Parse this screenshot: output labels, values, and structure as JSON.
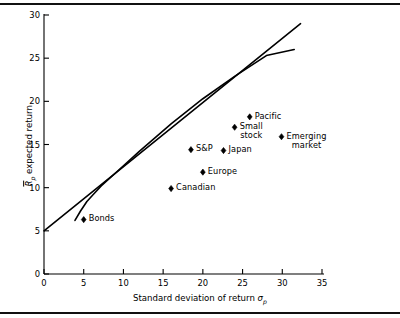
{
  "chart_data": {
    "type": "scatter",
    "title": "",
    "xlabel": "Standard deviation of return σp",
    "ylabel": "Rp expected return",
    "xlim": [
      0,
      35
    ],
    "ylim": [
      0,
      30
    ],
    "xticks": [
      0,
      5,
      10,
      15,
      20,
      25,
      30,
      35
    ],
    "yticks": [
      0,
      5,
      10,
      15,
      20,
      25,
      30
    ],
    "grid": false,
    "legend": "none",
    "points": [
      {
        "label": "Bonds",
        "x": 5.0,
        "y": 6.3,
        "label_lines": [
          "Bonds"
        ],
        "label_align": "right"
      },
      {
        "label": "Canadian",
        "x": 16.0,
        "y": 9.9,
        "label_lines": [
          "Canadian"
        ],
        "label_align": "right"
      },
      {
        "label": "Europe",
        "x": 20.0,
        "y": 11.8,
        "label_lines": [
          "Europe"
        ],
        "label_align": "right"
      },
      {
        "label": "S&P",
        "x": 18.5,
        "y": 14.4,
        "label_lines": [
          "S&P"
        ],
        "label_align": "right"
      },
      {
        "label": "Japan",
        "x": 22.6,
        "y": 14.3,
        "label_lines": [
          "Japan"
        ],
        "label_align": "right"
      },
      {
        "label": "Small stock",
        "x": 24.0,
        "y": 17.0,
        "label_lines": [
          "Small",
          "stock"
        ],
        "label_align": "right"
      },
      {
        "label": "Pacific",
        "x": 25.9,
        "y": 18.2,
        "label_lines": [
          "Pacific"
        ],
        "label_align": "right"
      },
      {
        "label": "Emerging market",
        "x": 29.9,
        "y": 15.9,
        "label_lines": [
          "Emerging",
          "market"
        ],
        "label_align": "right"
      }
    ],
    "lines": [
      {
        "name": "capital-market-line",
        "description": "Straight capital market line from the risk-free rate",
        "points": [
          [
            0,
            5.0
          ],
          [
            32.3,
            29.0
          ]
        ]
      },
      {
        "name": "efficient-frontier",
        "description": "Curved efficient frontier of risky assets, tangent to the capital market line",
        "points": [
          [
            3.9,
            6.2
          ],
          [
            4.6,
            7.3
          ],
          [
            5.4,
            8.4
          ],
          [
            6.2,
            9.2
          ],
          [
            7.2,
            10.2
          ],
          [
            9.0,
            11.7
          ],
          [
            12.0,
            14.2
          ],
          [
            16.0,
            17.4
          ],
          [
            20.0,
            20.3
          ],
          [
            24.0,
            22.9
          ],
          [
            28.0,
            25.3
          ],
          [
            31.5,
            26.0
          ]
        ]
      }
    ]
  },
  "axis": {
    "x_title_prefix": "Standard deviation of return ",
    "x_title_symbol": "σ",
    "x_title_sub": "p",
    "y_title_symbol": "R",
    "y_title_sub": "p",
    "y_title_suffix": " expected return"
  }
}
